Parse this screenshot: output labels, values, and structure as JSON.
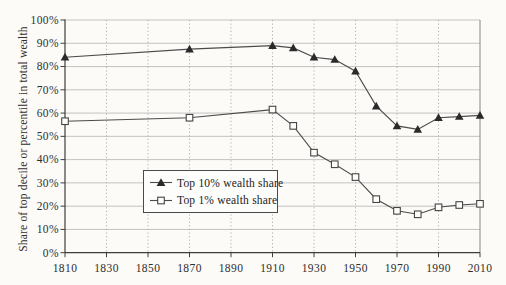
{
  "chart_data": {
    "type": "line",
    "title": "",
    "xlabel": "",
    "ylabel": "Share of top decile or percentile in total wealth",
    "xlim": [
      1810,
      2010
    ],
    "ylim": [
      0,
      100
    ],
    "grid": {
      "horizontal": "solid",
      "vertical": "dotted"
    },
    "legend_position": "bottom-center-inside",
    "x_ticks": [
      {
        "value": 1810,
        "label": "1810"
      },
      {
        "value": 1830,
        "label": "1830"
      },
      {
        "value": 1850,
        "label": "1850"
      },
      {
        "value": 1870,
        "label": "1870"
      },
      {
        "value": 1890,
        "label": "1890"
      },
      {
        "value": 1910,
        "label": "1910"
      },
      {
        "value": 1930,
        "label": "1930"
      },
      {
        "value": 1950,
        "label": "1950"
      },
      {
        "value": 1970,
        "label": "1970"
      },
      {
        "value": 1990,
        "label": "1990"
      },
      {
        "value": 2010,
        "label": "2010"
      }
    ],
    "y_ticks": [
      {
        "value": 0,
        "label": "0%"
      },
      {
        "value": 10,
        "label": "10%"
      },
      {
        "value": 20,
        "label": "20%"
      },
      {
        "value": 30,
        "label": "30%"
      },
      {
        "value": 40,
        "label": "40%"
      },
      {
        "value": 50,
        "label": "50%"
      },
      {
        "value": 60,
        "label": "60%"
      },
      {
        "value": 70,
        "label": "70%"
      },
      {
        "value": 80,
        "label": "80%"
      },
      {
        "value": 90,
        "label": "90%"
      },
      {
        "value": 100,
        "label": "100%"
      }
    ],
    "x": [
      1810,
      1870,
      1910,
      1920,
      1930,
      1940,
      1950,
      1960,
      1970,
      1980,
      1990,
      2000,
      2010
    ],
    "series": [
      {
        "name": "Top 10% wealth share",
        "marker": "triangle-filled",
        "values": [
          84,
          87.5,
          89,
          88,
          84,
          83,
          78,
          63,
          54.5,
          53,
          58,
          58.5,
          59
        ]
      },
      {
        "name": "Top 1% wealth share",
        "marker": "square-open",
        "values": [
          56.5,
          58,
          61.5,
          54.5,
          43,
          38,
          32.5,
          23,
          18,
          16.5,
          19.5,
          20.5,
          21
        ]
      }
    ],
    "colors": {
      "line": "#4b4b4b",
      "marker_fill": "#2a2a2a",
      "marker_open_fill": "#fdfdfb",
      "grid": "#bcbcbc",
      "grid_dotted": "#a9a9a9",
      "axis": "#3e3e3e",
      "right_border": "#909090",
      "text": "#2e2e2e",
      "background": "#fcfbf8"
    }
  }
}
